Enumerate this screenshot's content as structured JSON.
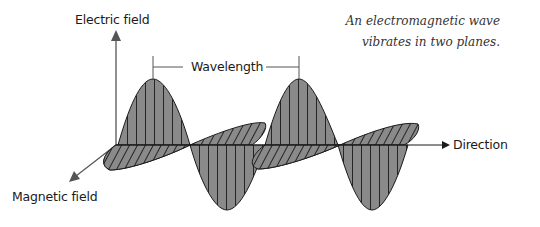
{
  "labels": {
    "electric_field": "Electric field",
    "magnetic_field": "Magnetic field",
    "direction": "Direction",
    "wavelength": "Wavelength"
  },
  "caption": {
    "line1": "An electromagnetic wave",
    "line2": "vibrates in two planes."
  },
  "colors": {
    "wave_fill": "#8a8a8a",
    "line": "#1a1a1a",
    "axis": "#555555",
    "background": "#ffffff"
  }
}
